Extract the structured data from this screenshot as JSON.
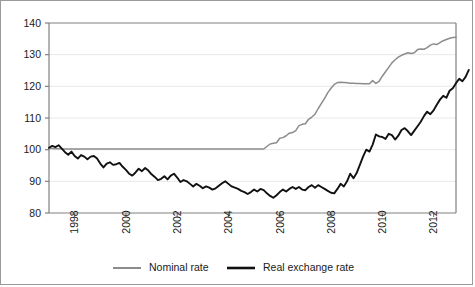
{
  "chart_data": {
    "type": "line",
    "title": "",
    "xlabel": "",
    "ylabel": "",
    "ylim": [
      80,
      140
    ],
    "yticks": [
      80,
      90,
      100,
      110,
      120,
      130,
      140
    ],
    "xlim": [
      1997.0,
      1913.75
    ],
    "xticks": [
      1998,
      2000,
      2002,
      2004,
      2006,
      2008,
      2010,
      2012
    ],
    "xtick_labels": [
      "1998",
      "2000",
      "2002",
      "2004",
      "2006",
      "2008",
      "2010",
      "2012"
    ],
    "xtick_rotation": 90,
    "grid": "horizontal",
    "legend_position": "bottom",
    "colors": {
      "nominal": "#8c8c8c",
      "real": "#111111",
      "grid": "#e8e8e8",
      "axis": "#808080",
      "frame": "#9a9a9a"
    },
    "x_start": 1997.0,
    "x_step": 0.125,
    "series": [
      {
        "name": "Nominal rate",
        "color": "#8c8c8c",
        "values": [
          100.4,
          100.4,
          100.3,
          100.3,
          100.2,
          100.2,
          100.2,
          100.2,
          100.2,
          100.2,
          100.2,
          100.2,
          100.2,
          100.2,
          100.2,
          100.2,
          100.2,
          100.2,
          100.2,
          100.2,
          100.2,
          100.2,
          100.2,
          100.2,
          100.2,
          100.2,
          100.2,
          100.2,
          100.2,
          100.2,
          100.2,
          100.2,
          100.2,
          100.2,
          100.2,
          100.2,
          100.2,
          100.2,
          100.2,
          100.2,
          100.2,
          100.2,
          100.2,
          100.2,
          100.2,
          100.2,
          100.2,
          100.2,
          100.2,
          100.2,
          100.2,
          100.2,
          100.2,
          100.2,
          100.2,
          100.2,
          100.2,
          100.2,
          100.2,
          100.2,
          100.2,
          100.2,
          100.2,
          100.2,
          100.2,
          100.2,
          100.2,
          100.2,
          101.0,
          101.8,
          102.0,
          102.2,
          103.6,
          103.8,
          104.4,
          105.2,
          105.4,
          106.0,
          107.6,
          108.0,
          108.2,
          109.6,
          110.3,
          111.2,
          113.0,
          114.6,
          116.2,
          118.0,
          119.4,
          120.6,
          121.2,
          121.3,
          121.2,
          121.1,
          121.0,
          121.0,
          120.9,
          120.9,
          120.8,
          120.8,
          120.8,
          121.8,
          120.9,
          121.6,
          123.2,
          124.6,
          126.0,
          127.4,
          128.4,
          129.2,
          129.8,
          130.2,
          130.6,
          130.4,
          130.6,
          131.6,
          131.8,
          131.7,
          132.2,
          133.0,
          133.4,
          133.2,
          133.8,
          134.4,
          134.8,
          135.2,
          135.4,
          135.5
        ]
      },
      {
        "name": "Real exchange rate",
        "color": "#111111",
        "values": [
          100.6,
          101.2,
          100.8,
          101.4,
          100.3,
          99.2,
          98.4,
          99.4,
          98.0,
          97.2,
          98.3,
          97.8,
          97.0,
          97.8,
          98.0,
          97.2,
          95.6,
          94.4,
          95.6,
          96.0,
          95.2,
          95.4,
          95.8,
          94.6,
          93.6,
          92.4,
          91.8,
          92.8,
          94.0,
          93.2,
          94.2,
          93.4,
          92.2,
          91.4,
          90.4,
          90.8,
          91.6,
          90.6,
          91.8,
          92.4,
          91.2,
          89.8,
          90.4,
          90.0,
          89.2,
          88.4,
          89.2,
          88.6,
          87.8,
          88.4,
          88.0,
          87.4,
          87.8,
          88.6,
          89.4,
          90.0,
          89.2,
          88.4,
          88.0,
          87.6,
          87.0,
          86.6,
          86.0,
          86.6,
          87.4,
          86.8,
          87.6,
          87.2,
          86.2,
          85.4,
          84.8,
          85.6,
          86.6,
          87.4,
          86.8,
          87.6,
          88.2,
          87.6,
          88.2,
          87.4,
          87.2,
          88.2,
          88.8,
          88.0,
          88.8,
          88.2,
          87.6,
          87.0,
          86.4,
          86.2,
          87.6,
          89.2,
          88.4,
          90.0,
          92.4,
          91.0,
          92.6,
          95.2,
          97.8,
          100.0,
          99.4,
          101.6,
          104.8,
          104.2,
          104.0,
          103.4,
          105.0,
          104.6,
          103.2,
          104.4,
          106.2,
          106.8,
          105.8,
          104.6,
          106.0,
          107.4,
          108.8,
          110.6,
          112.0,
          111.2,
          112.4,
          114.2,
          115.8,
          117.0,
          116.4,
          118.6,
          119.4,
          121.0,
          122.4,
          121.6,
          123.0,
          125.2
        ]
      }
    ]
  },
  "legend": {
    "items": [
      {
        "label": "Nominal rate",
        "color": "#8c8c8c",
        "width": 2
      },
      {
        "label": "Real exchange rate",
        "color": "#111111",
        "width": 2.6
      }
    ]
  }
}
